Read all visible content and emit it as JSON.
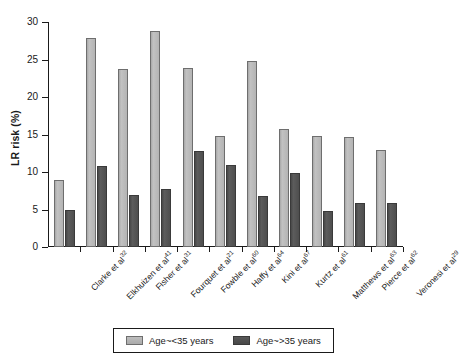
{
  "chart_data": {
    "type": "bar",
    "title": "",
    "xlabel": "",
    "ylabel": "LR risk (%)",
    "ylim": [
      0,
      30
    ],
    "yticks": [
      0,
      5,
      10,
      15,
      20,
      25,
      30
    ],
    "ytick_labels": [
      "0",
      "5",
      "10",
      "15",
      "20",
      "25",
      "30"
    ],
    "grid": false,
    "legend_position": "bottom",
    "categories": [
      "Clarke et al",
      "Elkhuizen et al",
      "Fisher et al",
      "Fourquet et al",
      "Fowble et al",
      "Haffy et al",
      "Kini et al",
      "Kurtz et al",
      "Matthews et al",
      "Pierce et al",
      "Veronesi et al"
    ],
    "category_refs": [
      "32",
      "41",
      "31",
      "21",
      "60",
      "64",
      "67",
      "61",
      "63",
      "62",
      "29"
    ],
    "series": [
      {
        "name": "Age~<35 years",
        "color": "#b4b4b4",
        "values": [
          8.9,
          27.9,
          23.8,
          28.8,
          23.9,
          14.8,
          24.8,
          15.7,
          14.8,
          14.7,
          12.9
        ]
      },
      {
        "name": "Age~>35 years",
        "color": "#4e4e4e",
        "values": [
          4.9,
          10.8,
          6.9,
          7.8,
          12.8,
          10.9,
          6.8,
          9.9,
          4.8,
          5.9,
          5.9
        ]
      }
    ]
  },
  "legend": {
    "items": [
      {
        "label": "Age~<35 years",
        "swatch": "light"
      },
      {
        "label": "Age~>35 years",
        "swatch": "dark"
      }
    ]
  }
}
